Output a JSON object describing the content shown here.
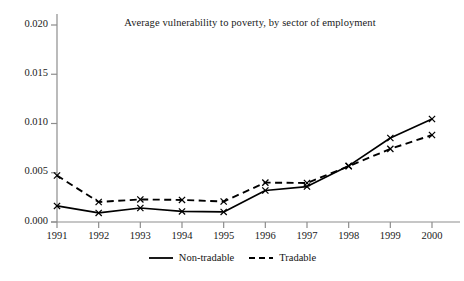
{
  "chart_data": {
    "type": "line",
    "title": "Average vulnerability to poverty, by sector of employment",
    "xlabel": "",
    "ylabel": "",
    "x": [
      1991,
      1992,
      1993,
      1994,
      1995,
      1996,
      1997,
      1998,
      1999,
      2000
    ],
    "categories": [
      "1991",
      "1992",
      "1993",
      "1994",
      "1995",
      "1996",
      "1997",
      "1998",
      "1999",
      "2000"
    ],
    "xlim": [
      1991,
      2000
    ],
    "ylim": [
      0.0,
      0.02
    ],
    "yticks": [
      0.0,
      0.005,
      0.01,
      0.015,
      0.02
    ],
    "ytick_labels": [
      "0.000",
      "0.005",
      "0.010",
      "0.015",
      "0.020"
    ],
    "xticks": [
      1991,
      1992,
      1993,
      1994,
      1995,
      1996,
      1997,
      1998,
      1999,
      2000
    ],
    "grid": false,
    "legend_position": "bottom-center",
    "marker": "x",
    "series": [
      {
        "name": "Non-tradable",
        "style": "solid",
        "color": "#000000",
        "values": [
          0.00163,
          0.00092,
          0.00142,
          0.00107,
          0.00102,
          0.0032,
          0.0036,
          0.0057,
          0.00853,
          0.01046
        ]
      },
      {
        "name": "Tradable",
        "style": "dashed",
        "color": "#000000",
        "values": [
          0.00472,
          0.00203,
          0.00229,
          0.00224,
          0.00208,
          0.004,
          0.00396,
          0.00566,
          0.00742,
          0.00883
        ]
      }
    ]
  },
  "legend": {
    "items": [
      {
        "label": "Non-tradable",
        "style": "solid"
      },
      {
        "label": "Tradable",
        "style": "dashed"
      }
    ]
  }
}
